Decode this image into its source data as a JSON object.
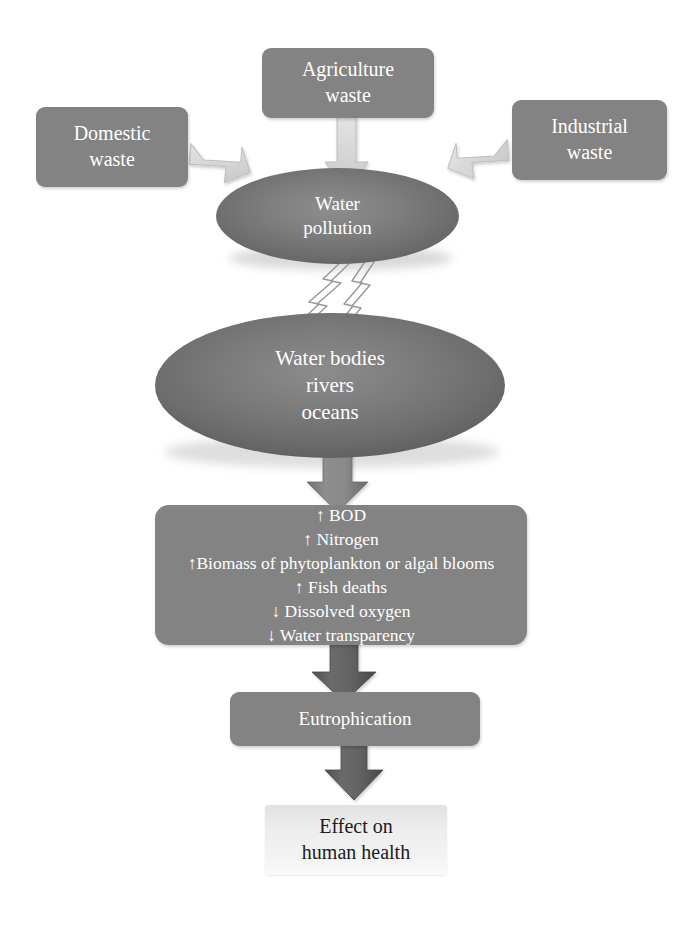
{
  "diagram": {
    "background": "#ffffff",
    "colors": {
      "box_fill": "#838383",
      "ellipse_fill": "#757575",
      "light_arrow": "#d6d6d6",
      "mid_arrow": "#8a8a8a",
      "dark_arrow": "#5a5a5a",
      "box_text": "#ffffff",
      "final_box_fill": "#eeeeee",
      "final_box_text": "#1b1b1b"
    }
  },
  "nodes": {
    "agriculture": {
      "label": "Agriculture\nwaste",
      "shape": "rounded-rect"
    },
    "domestic": {
      "label": "Domestic\nwaste",
      "shape": "rounded-rect"
    },
    "industrial": {
      "label": "Industrial\nwaste",
      "shape": "rounded-rect"
    },
    "water_pollution": {
      "label": "Water\npollution",
      "shape": "ellipse"
    },
    "water_bodies": {
      "label": "Water bodies\nrivers\noceans",
      "shape": "ellipse"
    },
    "effects": {
      "shape": "rounded-rect",
      "lines": [
        "↑ BOD",
        "↑ Nitrogen",
        "↑Biomass of phytoplankton or algal blooms",
        "↑ Fish deaths",
        "↓ Dissolved oxygen",
        "↓ Water transparency"
      ],
      "label": "↑ BOD\n↑ Nitrogen\n↑Biomass of phytoplankton or algal blooms\n↑ Fish deaths\n↓ Dissolved oxygen\n↓ Water transparency"
    },
    "eutrophication": {
      "label": "Eutrophication",
      "shape": "rounded-rect"
    },
    "health": {
      "label": "Effect on\nhuman health",
      "shape": "rect"
    }
  },
  "connectors": [
    {
      "name": "agriculture-to-pollution",
      "from": "agriculture",
      "to": "water_pollution",
      "style": "block-arrow-down",
      "tone": "light"
    },
    {
      "name": "domestic-to-pollution",
      "from": "domestic",
      "to": "water_pollution",
      "style": "block-arrow-diagonal",
      "tone": "light"
    },
    {
      "name": "industrial-to-pollution",
      "from": "industrial",
      "to": "water_pollution",
      "style": "block-arrow-diagonal",
      "tone": "light"
    },
    {
      "name": "pollution-to-waterbodies",
      "from": "water_pollution",
      "to": "water_bodies",
      "style": "lightning-bolt",
      "tone": "outline"
    },
    {
      "name": "waterbodies-to-effects",
      "from": "water_bodies",
      "to": "effects",
      "style": "block-arrow-down",
      "tone": "mid"
    },
    {
      "name": "effects-to-eutrophication",
      "from": "effects",
      "to": "eutrophication",
      "style": "block-arrow-down",
      "tone": "dark"
    },
    {
      "name": "eutrophication-to-health",
      "from": "eutrophication",
      "to": "health",
      "style": "block-arrow-down",
      "tone": "dark"
    }
  ]
}
